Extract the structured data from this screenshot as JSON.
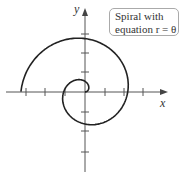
{
  "axes": {
    "x_label": "x",
    "y_label": "y"
  },
  "annotation": {
    "line1": "Spiral with",
    "line2": "equation r = θ"
  },
  "chart_data": {
    "type": "line",
    "title": "Spiral with equation r = θ",
    "equation": "r = θ",
    "theta_range": [
      0,
      9.42
    ],
    "xlabel": "x",
    "ylabel": "y",
    "tick_count_each_side": 3,
    "grid": false
  }
}
